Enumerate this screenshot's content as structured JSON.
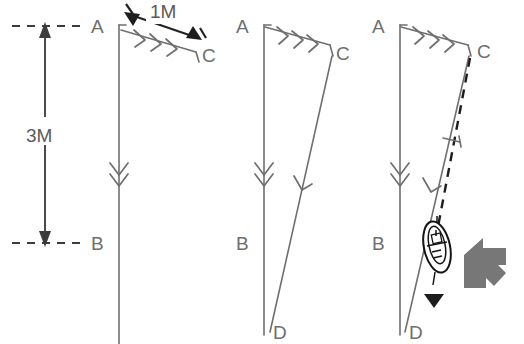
{
  "figure": {
    "background": "#ffffff",
    "width": 524,
    "height": 344,
    "line_color": "#6f6f6f",
    "dark_color": "#1d1d1d",
    "accent_gray": "#777777",
    "label_color": "#6e6e6e"
  },
  "dimensions": {
    "vertical_label": "3M",
    "diagonal_label": "1M"
  },
  "panels": [
    {
      "id": "panel-1",
      "name": "stage-one",
      "labels": {
        "a": "A",
        "b": "B",
        "c": "C"
      },
      "annotations": {
        "current_arrows": 3,
        "flow_arrows": 2,
        "dimension_vertical": "3M",
        "dimension_diagonal": "1M"
      }
    },
    {
      "id": "panel-2",
      "name": "stage-two",
      "labels": {
        "a": "A",
        "b": "B",
        "c": "C",
        "d": "D"
      },
      "annotations": {
        "current_arrows": 3,
        "flow_arrows": 2,
        "track_arrows": 1
      }
    },
    {
      "id": "panel-3",
      "name": "stage-three",
      "labels": {
        "a": "A",
        "b": "B",
        "c": "C",
        "d": "D"
      },
      "annotations": {
        "current_arrows": 3,
        "flow_arrows": 2,
        "track_arrows": 1,
        "has_dashed_bearing_line": true,
        "has_perpendicular_tick": true,
        "has_boat_symbol": true,
        "has_heading_arrowhead": true,
        "has_pointer": true
      }
    }
  ],
  "icons": {
    "boat": "boat-icon",
    "pointer": "gray-pointer-arrow-icon",
    "chevron": "chevron-arrow-icon"
  }
}
